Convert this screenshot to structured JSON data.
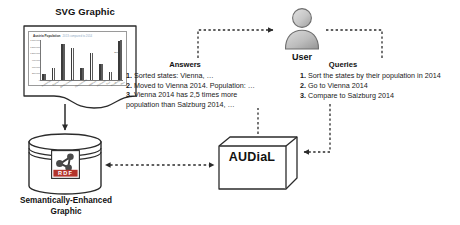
{
  "diagram": {
    "svg_graphic": {
      "label": "SVG Graphic",
      "icon": "document-with-chart-icon"
    },
    "answers": {
      "heading": "Answers",
      "items": [
        {
          "num": "1.",
          "text": "Sorted states: Vienna, …"
        },
        {
          "num": "2.",
          "text": "Moved to Vienna 2014. Population: …"
        },
        {
          "num": "3.",
          "text": "Vienna 2014 has 2,5 times more"
        }
      ],
      "continuation": "population than Salzburg 2014, …"
    },
    "queries": {
      "heading": "Queries",
      "items": [
        {
          "num": "1.",
          "text": "Sort the states by their population in 2014"
        },
        {
          "num": "2.",
          "text": "Go to Vienna 2014"
        },
        {
          "num": "3.",
          "text": "Compare to Salzburg 2014"
        }
      ]
    },
    "user": {
      "label": "User",
      "icon": "user-avatar-icon"
    },
    "store": {
      "label_line1": "Semantically-Enhanced",
      "label_line2": "Graphic",
      "badge_text": "RDF",
      "icon": "database-cylinder-icon"
    },
    "system": {
      "label": "AUDiaL",
      "icon": "cube-box-icon"
    },
    "colors": {
      "line": "#2b2b2b",
      "fill_light": "#ffffff",
      "fill_grey": "#c9c9c9",
      "text": "#111111",
      "rdf_red": "#b3342c",
      "chart_bar": "#3b3b3b"
    }
  },
  "chart_data": {
    "type": "bar",
    "title": "Austria Population",
    "subtitle": "2013 compared to 2014",
    "xlabel": "",
    "ylabel": "",
    "ylim": [
      0,
      1800000
    ],
    "grid": false,
    "legend": "2014",
    "categories": [
      "Burgenland",
      "Kärnten",
      "Niederösterreich",
      "Oberösterreich",
      "Salzburg",
      "Steiermark",
      "Tirol",
      "Vorarlberg",
      "Wien"
    ],
    "yticks": [
      "1.800.000",
      "1.500.000",
      "1.200.000",
      "900.000",
      "600.000",
      "300.000",
      "0"
    ],
    "series": [
      {
        "name": "2013",
        "values": [
          288000,
          556000,
          1618000,
          1425000,
          533000,
          1214000,
          716000,
          375000,
          1766000
        ]
      },
      {
        "name": "2014",
        "values": [
          291000,
          557000,
          1636000,
          1436000,
          537000,
          1217000,
          722000,
          378000,
          1794000
        ]
      }
    ]
  }
}
